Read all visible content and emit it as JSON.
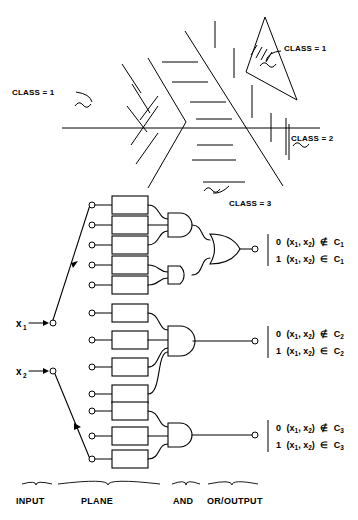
{
  "figure": {
    "regions": {
      "labels": [
        {
          "id": "class-1-left",
          "text": "CLASS = 1",
          "x": 12,
          "y": 92
        },
        {
          "id": "class-1-tri",
          "text": "CLASS = 1",
          "x": 281,
          "y": 48
        },
        {
          "id": "class-2-right",
          "text": "CLASS = 2",
          "x": 291,
          "y": 138
        },
        {
          "id": "class-3-bottom",
          "text": "CLASS = 3",
          "x": 229,
          "y": 203
        }
      ]
    },
    "inputs": [
      {
        "id": "x1",
        "base": "x",
        "sub": "1",
        "x": 16,
        "y": 324
      },
      {
        "id": "x2",
        "base": "x",
        "sub": "2",
        "x": 16,
        "y": 372
      }
    ],
    "plane_groups": [
      {
        "id": "group-c1",
        "box_count": 5,
        "and_gates": 2,
        "or_gates": 1
      },
      {
        "id": "group-c2",
        "box_count": 4,
        "and_gates": 1,
        "or_gates": 0
      },
      {
        "id": "group-c3",
        "box_count": 3,
        "and_gates": 1,
        "or_gates": 0
      }
    ],
    "outputs": [
      {
        "id": "out-c1",
        "lines": [
          {
            "value": "0",
            "tuple": "(x1, x2)",
            "rel": "∉",
            "set": "C",
            "set_sub": "1"
          },
          {
            "value": "1",
            "tuple": "(x1, x2)",
            "rel": "∈",
            "set": "C",
            "set_sub": "1"
          }
        ]
      },
      {
        "id": "out-c2",
        "lines": [
          {
            "value": "0",
            "tuple": "(x1, x2)",
            "rel": "∉",
            "set": "C",
            "set_sub": "2"
          },
          {
            "value": "1",
            "tuple": "(x1, x2)",
            "rel": "∈",
            "set": "C",
            "set_sub": "2"
          }
        ]
      },
      {
        "id": "out-c3",
        "lines": [
          {
            "value": "0",
            "tuple": "(x1, x2)",
            "rel": "∉",
            "set": "C",
            "set_sub": "3"
          },
          {
            "value": "1",
            "tuple": "(x1, x2)",
            "rel": "∈",
            "set": "C",
            "set_sub": "3"
          }
        ]
      }
    ],
    "stage_labels": [
      {
        "id": "stage-input",
        "text": "INPUT",
        "x": 16,
        "y": 501
      },
      {
        "id": "stage-plane",
        "text": "PLANE",
        "x": 107,
        "y": 501
      },
      {
        "id": "stage-and",
        "text": "AND",
        "x": 198,
        "y": 501
      },
      {
        "id": "stage-output",
        "text": "OR/OUTPUT",
        "x": 233,
        "y": 501
      }
    ],
    "colors": {
      "ink": "#000000",
      "paper": "#ffffff"
    }
  }
}
